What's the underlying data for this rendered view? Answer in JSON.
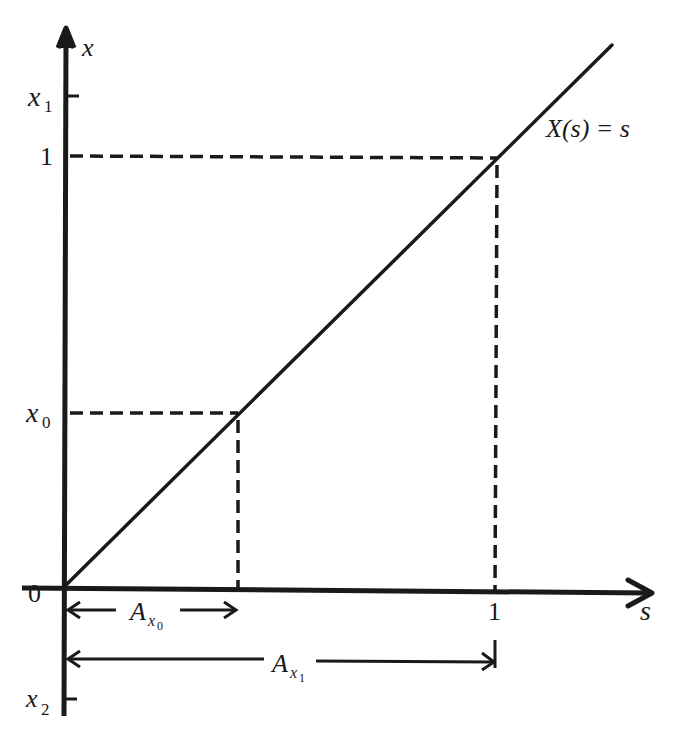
{
  "diagram": {
    "title": "",
    "axes": {
      "horizontal": {
        "label": "s",
        "ticks": [
          "0",
          "1"
        ]
      },
      "vertical": {
        "label": "x",
        "ticks": [
          "x1",
          "1",
          "x0",
          "x2"
        ]
      }
    },
    "tick_labels": {
      "origin": "0",
      "s_one": "1",
      "x_one": "1",
      "x1_base": "x",
      "x1_sub": "1",
      "x0_base": "x",
      "x0_sub": "0",
      "x2_base": "x",
      "x2_sub": "2"
    },
    "axis_labels": {
      "s": "s",
      "x": "x"
    },
    "curve_label": "X(s) = s",
    "intervals": [
      {
        "name": "A_x0",
        "base": "A",
        "sub_base": "x",
        "sub_sub": "0",
        "from_s": 0,
        "to_s": 0.4
      },
      {
        "name": "A_x1",
        "base": "A",
        "sub_base": "x",
        "sub_sub": "1",
        "from_s": 0,
        "to_s": 1
      }
    ],
    "guides": [
      {
        "type": "horizontal-dashed",
        "at": "x0",
        "from_s": 0,
        "to_s": 0.4
      },
      {
        "type": "vertical-dashed",
        "at_s": 0.4,
        "from": "x0",
        "to": 0
      },
      {
        "type": "horizontal-dashed",
        "at": "1",
        "from_s": 0,
        "to_s": 1
      },
      {
        "type": "vertical-dashed",
        "at_s": 1,
        "from": "1",
        "to": 0
      }
    ]
  }
}
